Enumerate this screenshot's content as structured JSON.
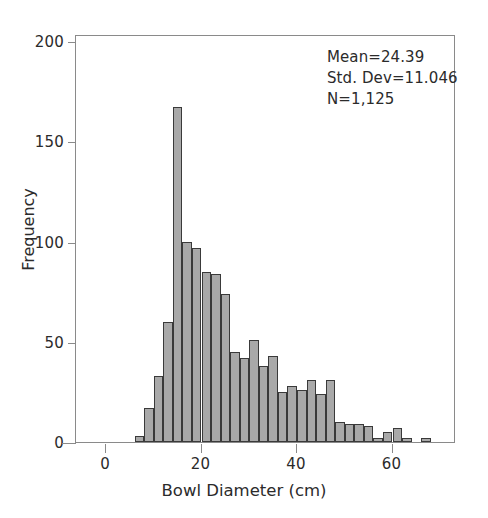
{
  "chart_data": {
    "type": "bar",
    "title": "",
    "xlabel": "Bowl Diameter (cm)",
    "ylabel": "Frequency",
    "xlim": [
      -2,
      72
    ],
    "ylim": [
      0,
      210
    ],
    "grid": false,
    "legend": null,
    "bin_width": 2,
    "bar_color": "#a9a9a9",
    "bar_edge_color": "#3a3a3a",
    "x_ticks": [
      0,
      20,
      40,
      60
    ],
    "x_tick_labels": [
      "0",
      "20",
      "40",
      "60"
    ],
    "y_ticks": [
      0,
      50,
      100,
      150,
      200
    ],
    "y_tick_labels": [
      "0",
      "50",
      "100",
      "150",
      "200"
    ],
    "categories": [
      7,
      9,
      11,
      13,
      15,
      17,
      19,
      21,
      23,
      25,
      27,
      29,
      31,
      33,
      35,
      37,
      39,
      41,
      43,
      45,
      47,
      49,
      51,
      53,
      55,
      57,
      59,
      61,
      63,
      65,
      67
    ],
    "bin_edges": [
      6,
      8,
      10,
      12,
      14,
      16,
      18,
      20,
      22,
      24,
      26,
      28,
      30,
      32,
      34,
      36,
      38,
      40,
      42,
      44,
      46,
      48,
      50,
      52,
      54,
      56,
      58,
      60,
      62,
      64,
      66,
      68
    ],
    "values": [
      3,
      17,
      33,
      60,
      167,
      100,
      97,
      85,
      84,
      74,
      45,
      42,
      51,
      38,
      43,
      25,
      28,
      26,
      31,
      24,
      31,
      10,
      9,
      9,
      8,
      2,
      5,
      7,
      2,
      0,
      2
    ],
    "series": [
      {
        "name": "Frequency",
        "values": [
          3,
          17,
          33,
          60,
          167,
          100,
          97,
          85,
          84,
          74,
          45,
          42,
          51,
          38,
          43,
          25,
          28,
          26,
          31,
          24,
          31,
          10,
          9,
          9,
          8,
          2,
          5,
          7,
          2,
          0,
          2
        ]
      }
    ],
    "annotations": {
      "mean_label": "Mean=24.39",
      "std_dev_label": "Std. Dev=11.046",
      "n_label": "N=1,125",
      "mean": 24.39,
      "std_dev": 11.046,
      "n": 1125
    }
  }
}
